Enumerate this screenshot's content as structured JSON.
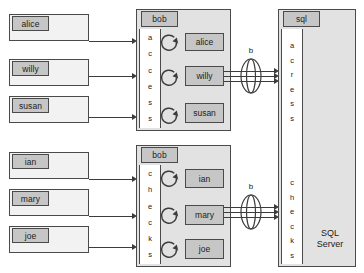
{
  "diagram": {
    "title_hidden": "",
    "colors": {
      "outline": "#4a4a4a",
      "tab_fill": "#c6c6c6",
      "container_fill": "#e2e2e2",
      "box_fill": "#f2f2f2",
      "strip_fill": "#ffffff",
      "arrow": "#3c3c3c",
      "text": "#1c1c1c"
    },
    "rows": [
      {
        "id": "row-access",
        "clients": [
          {
            "label": "alice"
          },
          {
            "label": "willy"
          },
          {
            "label": "susan"
          }
        ],
        "middle": {
          "tab_label": "bob",
          "vertical_label": "access",
          "vertical_letters": [
            "a",
            "c",
            "c",
            "e",
            "s",
            "s"
          ],
          "loop_icon": "circular-arrow-icon",
          "items": [
            {
              "label": "alice"
            },
            {
              "label": "willy"
            },
            {
              "label": "susan"
            }
          ]
        },
        "bundle": {
          "label": "b",
          "icon": "arrow-bundle-icon",
          "arrow_count": 3
        },
        "server": {
          "tab_label": "sql",
          "vertical_label": "access",
          "vertical_letters": [
            "a",
            "c",
            "r",
            "e",
            "s",
            "s"
          ],
          "name": ""
        }
      },
      {
        "id": "row-checks",
        "clients": [
          {
            "label": "ian"
          },
          {
            "label": "mary"
          },
          {
            "label": "joe"
          }
        ],
        "middle": {
          "tab_label": "bob",
          "vertical_label": "checks",
          "vertical_letters": [
            "c",
            "h",
            "e",
            "c",
            "k",
            "s"
          ],
          "loop_icon": "circular-arrow-icon",
          "items": [
            {
              "label": "ian"
            },
            {
              "label": "mary"
            },
            {
              "label": "joe"
            }
          ]
        },
        "bundle": {
          "label": "b",
          "icon": "arrow-bundle-icon",
          "arrow_count": 3
        },
        "server": {
          "tab_label": "",
          "vertical_label": "checks",
          "vertical_letters": [
            "c",
            "h",
            "e",
            "c",
            "k",
            "s"
          ],
          "name": "SQL\nServer"
        }
      }
    ]
  }
}
